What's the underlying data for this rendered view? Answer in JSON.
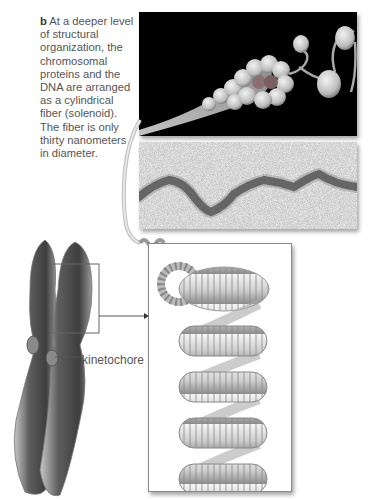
{
  "figure": {
    "caption_letter": "b",
    "caption_text": "At a deeper level of structural organization, the chromosomal proteins and the DNA are arranged as a cylindrical fiber (solenoid). The fiber is only thirty nanometers in diameter.",
    "panels": [
      {
        "id": "panel-a",
        "description": "Illustration of nucleosomes coiling into solenoid fiber on black background"
      },
      {
        "id": "panel-b",
        "description": "Electron micrograph of chromatin fiber"
      },
      {
        "id": "panel-c",
        "description": "Illustration of supercoiled solenoid fiber forming helical loops"
      }
    ],
    "labels": {
      "kinetochore": "kinetochore"
    },
    "colors": {
      "text": "#555555",
      "panel_dark": "#000000",
      "micrograph_bg": "#e4e4e4",
      "chromosome": "#6a6a6a"
    }
  }
}
